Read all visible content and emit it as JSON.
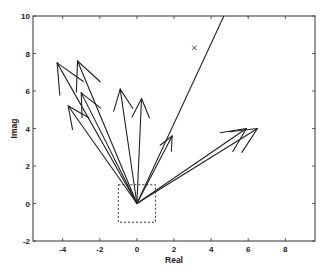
{
  "chart_data": {
    "type": "compass",
    "title": "",
    "xlabel": "Real",
    "ylabel": "Imag",
    "xlim": [
      -5.6,
      9.6
    ],
    "ylim": [
      -2,
      10
    ],
    "xticks": [
      -4,
      -2,
      0,
      2,
      4,
      6,
      8
    ],
    "yticks": [
      -2,
      0,
      2,
      4,
      6,
      8,
      10
    ],
    "xtick_labels": [
      "-4",
      "-2",
      "0",
      "2",
      "4",
      "6",
      "8"
    ],
    "ytick_labels": [
      "-2",
      "0",
      "2",
      "4",
      "6",
      "8",
      "10"
    ],
    "grid": false,
    "legend": null,
    "vectors": [
      {
        "x": -4.3,
        "y": 7.5
      },
      {
        "x": -3.2,
        "y": 7.6
      },
      {
        "x": -3.0,
        "y": 5.9
      },
      {
        "x": -3.7,
        "y": 5.2
      },
      {
        "x": -0.9,
        "y": 6.1
      },
      {
        "x": 0.25,
        "y": 5.6
      },
      {
        "x": 1.9,
        "y": 3.6
      },
      {
        "x": 5.9,
        "y": 4.0
      },
      {
        "x": 6.5,
        "y": 4.0
      },
      {
        "x": 6.0,
        "y": 12.8
      }
    ],
    "markers": [
      {
        "symbol": "x",
        "x": 3.1,
        "y": 8.3
      }
    ],
    "dashed_box": {
      "x": [
        -1,
        1
      ],
      "y": [
        -1,
        1
      ]
    },
    "colors": {
      "line": "#222222",
      "axes": "#333333",
      "background": "#ffffff"
    }
  }
}
